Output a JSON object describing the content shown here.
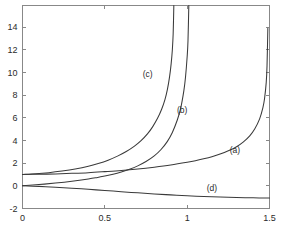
{
  "figure": {
    "title": "",
    "background_color": "#ffffff",
    "axis_color": "#888888",
    "curve_color": "#3a3a3a",
    "text_color": "#2b2b2b"
  },
  "chart_data": {
    "type": "line",
    "title": "",
    "xlabel": "",
    "ylabel": "",
    "xlim": [
      0,
      1.5
    ],
    "ylim": [
      -2,
      15.9
    ],
    "grid": false,
    "legend": "inline-labels",
    "xticks": [
      0,
      0.5,
      1,
      1.5
    ],
    "xticklabels": [
      "0",
      "0.5",
      "1",
      "1.5"
    ],
    "yticks": [
      -2,
      0,
      2,
      4,
      6,
      8,
      10,
      12,
      14
    ],
    "yticklabels": [
      "-2",
      "0",
      "2",
      "4",
      "6",
      "8",
      "10",
      "12",
      "14"
    ],
    "series": [
      {
        "name": "(a)",
        "label": "(a)",
        "label_x": 1.29,
        "label_y": 2.9,
        "asymptote_x": 1.52,
        "x": [
          0.0,
          0.1,
          0.2,
          0.3,
          0.4,
          0.5,
          0.6,
          0.7,
          0.8,
          0.9,
          1.0,
          1.05,
          1.1,
          1.15,
          1.2,
          1.25,
          1.3,
          1.34,
          1.38,
          1.41,
          1.44,
          1.46,
          1.47,
          1.48,
          1.485,
          1.49
        ],
        "y": [
          1.0,
          1.02,
          1.05,
          1.1,
          1.16,
          1.25,
          1.35,
          1.48,
          1.64,
          1.83,
          2.07,
          2.21,
          2.38,
          2.57,
          2.8,
          3.09,
          3.45,
          3.85,
          4.4,
          5.0,
          5.9,
          6.9,
          7.7,
          9.1,
          10.6,
          13.9
        ]
      },
      {
        "name": "(b)",
        "label": "(b)",
        "label_x": 0.97,
        "label_y": 6.4,
        "asymptote_x": 1.03,
        "x": [
          0.0,
          0.1,
          0.2,
          0.3,
          0.4,
          0.45,
          0.5,
          0.55,
          0.6,
          0.65,
          0.7,
          0.75,
          0.8,
          0.84,
          0.88,
          0.91,
          0.94,
          0.96,
          0.98,
          0.99,
          1.0,
          1.005,
          1.01
        ],
        "y": [
          0.0,
          0.11,
          0.24,
          0.4,
          0.6,
          0.72,
          0.86,
          1.02,
          1.22,
          1.46,
          1.76,
          2.14,
          2.64,
          3.18,
          3.92,
          4.7,
          5.8,
          6.8,
          8.4,
          9.6,
          11.4,
          12.8,
          15.9
        ]
      },
      {
        "name": "(c)",
        "label": "(c)",
        "label_x": 0.76,
        "label_y": 9.6,
        "asymptote_x": 0.925,
        "x": [
          0.0,
          0.08,
          0.16,
          0.24,
          0.32,
          0.4,
          0.46,
          0.52,
          0.58,
          0.63,
          0.68,
          0.72,
          0.76,
          0.79,
          0.82,
          0.845,
          0.865,
          0.88,
          0.893,
          0.903,
          0.91,
          0.915,
          0.919
        ],
        "y": [
          1.0,
          1.06,
          1.16,
          1.3,
          1.48,
          1.72,
          1.96,
          2.26,
          2.64,
          3.02,
          3.5,
          3.98,
          4.6,
          5.2,
          5.95,
          6.75,
          7.6,
          8.5,
          9.6,
          10.8,
          12.0,
          13.4,
          15.9
        ]
      },
      {
        "name": "(d)",
        "label": "(d)",
        "label_x": 1.15,
        "label_y": -0.45,
        "asymptote_x": null,
        "x": [
          0.0,
          0.1,
          0.2,
          0.3,
          0.4,
          0.5,
          0.6,
          0.7,
          0.8,
          0.9,
          1.0,
          1.1,
          1.2,
          1.3,
          1.4,
          1.5
        ],
        "y": [
          0.0,
          -0.05,
          -0.12,
          -0.21,
          -0.31,
          -0.41,
          -0.52,
          -0.62,
          -0.72,
          -0.8,
          -0.88,
          -0.94,
          -0.99,
          -1.03,
          -1.06,
          -1.08
        ]
      }
    ]
  }
}
